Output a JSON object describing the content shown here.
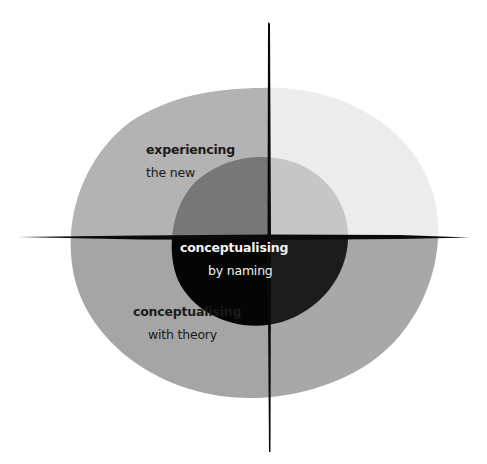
{
  "diagram": {
    "quadrant_labels": {
      "top_left": {
        "title": "experiencing",
        "subtitle": "the new"
      },
      "center": {
        "title": "conceptualising",
        "subtitle": "by naming"
      },
      "bottom_left": {
        "title": "conceptualising",
        "subtitle": "with theory"
      }
    },
    "colors": {
      "background": "#ffffff",
      "outer_top_left": "#b3b3b3",
      "outer_top_right": "#ececec",
      "outer_bottom_left": "#a5a5a5",
      "outer_bottom_right": "#a8a8a8",
      "inner_top_left": "#777777",
      "inner_top_right": "#c6c6c6",
      "inner_bottom_left": "#050505",
      "inner_bottom_right": "#1c1c1c",
      "axis": "#0a0a0a",
      "text_dark": "#1a1a1a",
      "text_light": "#f2f2f2"
    }
  }
}
